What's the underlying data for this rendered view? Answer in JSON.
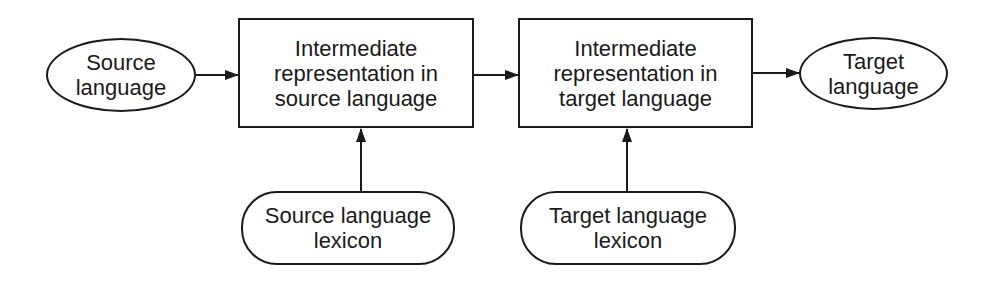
{
  "diagram": {
    "nodes": {
      "source_language": {
        "shape": "ellipse",
        "lines": [
          "Source",
          "language"
        ]
      },
      "ir_source": {
        "shape": "rectangle",
        "lines": [
          "Intermediate",
          "representation in",
          "source language"
        ]
      },
      "ir_target": {
        "shape": "rectangle",
        "lines": [
          "Intermediate",
          "representation in",
          "target language"
        ]
      },
      "target_language": {
        "shape": "ellipse",
        "lines": [
          "Target",
          "language"
        ]
      },
      "source_lexicon": {
        "shape": "rounded-rectangle",
        "lines": [
          "Source language",
          "lexicon"
        ]
      },
      "target_lexicon": {
        "shape": "rounded-rectangle",
        "lines": [
          "Target language",
          "lexicon"
        ]
      }
    },
    "edges": [
      {
        "from": "source_language",
        "to": "ir_source"
      },
      {
        "from": "ir_source",
        "to": "ir_target"
      },
      {
        "from": "ir_target",
        "to": "target_language"
      },
      {
        "from": "source_lexicon",
        "to": "ir_source"
      },
      {
        "from": "target_lexicon",
        "to": "ir_target"
      }
    ],
    "colors": {
      "stroke": "#1a1a1a",
      "background": "#ffffff"
    }
  }
}
